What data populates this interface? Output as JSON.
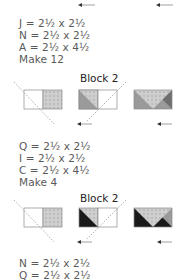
{
  "sections": [
    {
      "specs": [
        "J = 2½ x 2½",
        "N = 2½ x 2½",
        "A = 2½ x 4½",
        "Make 12"
      ],
      "block_title": "Block 2",
      "steps": [
        {
          "name": "step-1",
          "left_fill": "white",
          "right_fill": "light-print"
        },
        {
          "name": "step-2",
          "left_fill": "medium-triangle",
          "right_fill": "white"
        },
        {
          "name": "step-3",
          "fill": "flying-geese-medium-dark"
        }
      ]
    },
    {
      "specs": [
        "Q = 2½ x 2½",
        "I = 2½ x 2½",
        "C = 2½ x 4½",
        "Make 4"
      ],
      "block_title": "Block 2",
      "steps": [
        {
          "name": "step-1",
          "left_fill": "white",
          "right_fill": "light-print"
        },
        {
          "name": "step-2",
          "left_fill": "black-triangle",
          "right_fill": "white"
        },
        {
          "name": "step-3",
          "fill": "flying-geese-black-medium"
        }
      ]
    },
    {
      "specs": [
        "N = 2½ x 2½",
        "Q = 2½ x 2½"
      ]
    }
  ],
  "colors": {
    "print_light": "#cfcfcf",
    "medium": "#9a9a9a",
    "dark": "#6e6e6e",
    "black": "#1a1a1a",
    "outline": "#8a8a8a",
    "arrow": "#444444"
  }
}
